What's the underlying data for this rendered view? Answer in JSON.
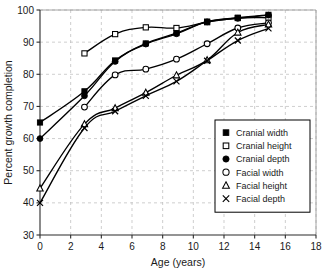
{
  "chart_data": {
    "type": "line",
    "title": "",
    "xlabel": "Age (years)",
    "ylabel": "Percent growth completion",
    "xlim": [
      0,
      18
    ],
    "ylim": [
      30,
      100
    ],
    "xticks": [
      0,
      2,
      4,
      6,
      8,
      10,
      12,
      14,
      16,
      18
    ],
    "yticks": [
      30,
      40,
      50,
      60,
      70,
      80,
      90,
      100
    ],
    "xtick_labels": [
      "0",
      "2",
      "4",
      "6",
      "8",
      "10",
      "12",
      "14",
      "16",
      "18"
    ],
    "ytick_labels": [
      "30",
      "40",
      "50",
      "60",
      "70",
      "80",
      "90",
      "100"
    ],
    "grid": true,
    "legend_position": "right-middle",
    "series": [
      {
        "name": "Cranial width",
        "marker": "filled-square",
        "x": [
          0,
          2.9,
          4.9,
          6.9,
          8.9,
          10.9,
          12.9,
          14.9
        ],
        "values": [
          65.0,
          74.7,
          84.3,
          89.6,
          92.8,
          96.4,
          97.6,
          98.5
        ]
      },
      {
        "name": "Cranial height",
        "marker": "open-square",
        "x": [
          2.9,
          4.9,
          6.9,
          8.9,
          10.9,
          12.9,
          14.9
        ],
        "values": [
          86.5,
          92.5,
          94.6,
          94.4,
          96.2,
          97.5,
          97.6
        ]
      },
      {
        "name": "Cranial depth",
        "marker": "filled-circle",
        "x": [
          0,
          2.9,
          4.9,
          6.9,
          8.9,
          10.9,
          12.9,
          14.9
        ],
        "values": [
          60.0,
          73.3,
          84.0,
          89.4,
          92.6,
          96.3,
          97.4,
          98.4
        ]
      },
      {
        "name": "Facial width",
        "marker": "open-circle",
        "x": [
          2.9,
          4.9,
          6.9,
          8.9,
          10.9,
          12.9,
          14.9
        ],
        "values": [
          69.8,
          79.8,
          81.6,
          84.7,
          89.5,
          94.4,
          96.0
        ]
      },
      {
        "name": "Facial height",
        "marker": "open-triangle",
        "x": [
          0,
          2.9,
          4.9,
          6.9,
          8.9,
          10.9,
          12.9,
          14.9
        ],
        "values": [
          44.5,
          64.5,
          69.5,
          74.3,
          79.7,
          84.4,
          93.0,
          95.5
        ]
      },
      {
        "name": "Facial depth",
        "marker": "cross",
        "x": [
          0,
          2.9,
          4.9,
          6.9,
          8.9,
          10.9,
          12.9,
          14.9
        ],
        "values": [
          40.0,
          63.3,
          68.5,
          73.3,
          77.8,
          84.2,
          90.5,
          94.3
        ]
      }
    ]
  },
  "axes": {
    "x_title": "Age (years)",
    "y_title": "Percent growth completion"
  },
  "legend": {
    "items": [
      {
        "label": "Cranial width",
        "marker": "filled-square"
      },
      {
        "label": "Cranial height",
        "marker": "open-square"
      },
      {
        "label": "Cranial depth",
        "marker": "filled-circle"
      },
      {
        "label": "Facial width",
        "marker": "open-circle"
      },
      {
        "label": "Facial height",
        "marker": "open-triangle"
      },
      {
        "label": "Facial depth",
        "marker": "cross"
      }
    ]
  },
  "colors": {
    "ink": "#000000",
    "grid": "#b9b9b9",
    "background": "#ffffff"
  }
}
